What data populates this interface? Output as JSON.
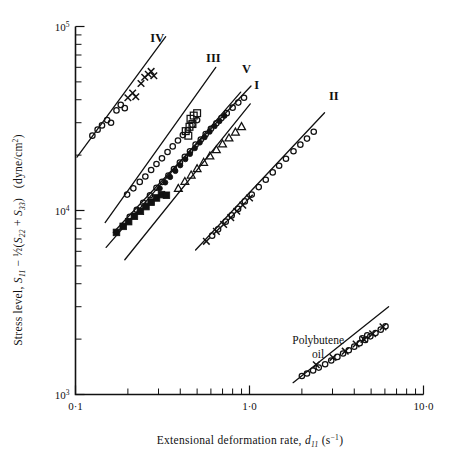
{
  "figure": {
    "background_color": "#ffffff",
    "ink_color": "#111111"
  },
  "chart_data": {
    "type": "scatter",
    "title": "",
    "subtitle": "",
    "xlabel": "Extensional deformation rate, d₁₁ (s⁻¹)",
    "ylabel": "Stress level, S₁₁ − ½(S₂₂ + S₃₃)  (dyne/cm²)",
    "xscale": "log",
    "yscale": "log",
    "xlim": [
      0.1,
      10.0
    ],
    "ylim": [
      1000,
      100000
    ],
    "grid": false,
    "legend_position": "inline-curve-labels",
    "xticks": [
      {
        "value": 0.1,
        "label": "0·1",
        "major": true
      },
      {
        "value": 0.2,
        "label": "",
        "major": false
      },
      {
        "value": 0.3,
        "label": "",
        "major": false
      },
      {
        "value": 0.4,
        "label": "",
        "major": false
      },
      {
        "value": 0.5,
        "label": "",
        "major": false
      },
      {
        "value": 0.6,
        "label": "",
        "major": false
      },
      {
        "value": 0.7,
        "label": "",
        "major": false
      },
      {
        "value": 0.8,
        "label": "",
        "major": false
      },
      {
        "value": 0.9,
        "label": "",
        "major": false
      },
      {
        "value": 1.0,
        "label": "1·0",
        "major": true
      },
      {
        "value": 2.0,
        "label": "",
        "major": false
      },
      {
        "value": 3.0,
        "label": "",
        "major": false
      },
      {
        "value": 4.0,
        "label": "",
        "major": false
      },
      {
        "value": 5.0,
        "label": "",
        "major": false
      },
      {
        "value": 6.0,
        "label": "",
        "major": false
      },
      {
        "value": 7.0,
        "label": "",
        "major": false
      },
      {
        "value": 8.0,
        "label": "",
        "major": false
      },
      {
        "value": 9.0,
        "label": "",
        "major": false
      },
      {
        "value": 10.0,
        "label": "10·0",
        "major": true
      }
    ],
    "yticks": [
      {
        "value": 1000,
        "label": "10³",
        "major": true
      },
      {
        "value": 2000,
        "label": "",
        "major": false
      },
      {
        "value": 3000,
        "label": "",
        "major": false
      },
      {
        "value": 4000,
        "label": "",
        "major": false
      },
      {
        "value": 5000,
        "label": "",
        "major": false
      },
      {
        "value": 6000,
        "label": "",
        "major": false
      },
      {
        "value": 7000,
        "label": "",
        "major": false
      },
      {
        "value": 8000,
        "label": "",
        "major": false
      },
      {
        "value": 9000,
        "label": "",
        "major": false
      },
      {
        "value": 10000,
        "label": "10⁴",
        "major": true
      },
      {
        "value": 20000,
        "label": "",
        "major": false
      },
      {
        "value": 30000,
        "label": "",
        "major": false
      },
      {
        "value": 40000,
        "label": "",
        "major": false
      },
      {
        "value": 50000,
        "label": "",
        "major": false
      },
      {
        "value": 60000,
        "label": "",
        "major": false
      },
      {
        "value": 70000,
        "label": "",
        "major": false
      },
      {
        "value": 80000,
        "label": "",
        "major": false
      },
      {
        "value": 90000,
        "label": "",
        "major": false
      },
      {
        "value": 100000,
        "label": "10⁵",
        "major": true
      }
    ],
    "axis_label_parts": {
      "y_prefix": "Stress level, ",
      "y_s11": "S",
      "y_s11_sub": "11",
      "y_minus": " − ",
      "y_half": "½",
      "y_open": "(",
      "y_s22": "S",
      "y_s22_sub": "22",
      "y_plus": " + ",
      "y_s33": "S",
      "y_s33_sub": "33",
      "y_close": ")",
      "y_units": "(dyne/cm",
      "y_units_sup": "2",
      "y_units_close": ")",
      "x_prefix": "Extensional deformation rate, ",
      "x_d": "d",
      "x_d_sub": "11",
      "x_units_open": " (s",
      "x_units_sup": "−1",
      "x_units_close": ")"
    },
    "annotations": [
      {
        "name": "polybutene-oil-label",
        "text_line1": "Polybutene",
        "text_line2": "oil",
        "x": 2.48,
        "y": 1880
      }
    ],
    "series": [
      {
        "name": "I",
        "label": "I",
        "label_x": 1.1,
        "label_y": 46000,
        "marker": "circle-open",
        "fit_line": {
          "x1": 0.165,
          "y1": 7600,
          "x2": 1.02,
          "y2": 47500
        },
        "points": [
          {
            "x": 0.205,
            "y": 9250
          },
          {
            "x": 0.225,
            "y": 10100
          },
          {
            "x": 0.245,
            "y": 11000
          },
          {
            "x": 0.268,
            "y": 12100
          },
          {
            "x": 0.292,
            "y": 13300
          },
          {
            "x": 0.315,
            "y": 14300
          },
          {
            "x": 0.342,
            "y": 15500
          },
          {
            "x": 0.368,
            "y": 16800
          },
          {
            "x": 0.398,
            "y": 18200
          },
          {
            "x": 0.425,
            "y": 19600
          },
          {
            "x": 0.455,
            "y": 21000
          },
          {
            "x": 0.49,
            "y": 22800
          },
          {
            "x": 0.525,
            "y": 24300
          },
          {
            "x": 0.56,
            "y": 26000
          },
          {
            "x": 0.6,
            "y": 27800
          },
          {
            "x": 0.645,
            "y": 29800
          },
          {
            "x": 0.69,
            "y": 31800
          },
          {
            "x": 0.74,
            "y": 33800
          },
          {
            "x": 0.8,
            "y": 36200
          },
          {
            "x": 0.862,
            "y": 38600
          },
          {
            "x": 0.93,
            "y": 41000
          }
        ]
      },
      {
        "name": "II",
        "label": "II",
        "label_x": 3.05,
        "label_y": 40000,
        "marker": "circle-open-and-cross",
        "fit_line": {
          "x1": 0.49,
          "y1": 6100,
          "x2": 2.7,
          "y2": 34000
        },
        "points": [
          {
            "x": 0.61,
            "y": 7300
          },
          {
            "x": 0.66,
            "y": 7900
          },
          {
            "x": 0.73,
            "y": 8700
          },
          {
            "x": 0.79,
            "y": 9400
          },
          {
            "x": 0.86,
            "y": 10200
          },
          {
            "x": 0.94,
            "y": 11200
          },
          {
            "x": 1.03,
            "y": 12200
          },
          {
            "x": 1.13,
            "y": 13400
          },
          {
            "x": 1.24,
            "y": 14700
          },
          {
            "x": 1.36,
            "y": 16100
          },
          {
            "x": 1.48,
            "y": 17500
          },
          {
            "x": 1.62,
            "y": 19100
          },
          {
            "x": 1.79,
            "y": 21000
          },
          {
            "x": 1.96,
            "y": 22800
          },
          {
            "x": 2.14,
            "y": 24600
          },
          {
            "x": 2.34,
            "y": 26800
          }
        ],
        "cross_points": [
          {
            "x": 0.565,
            "y": 6800
          },
          {
            "x": 0.645,
            "y": 7700
          },
          {
            "x": 0.71,
            "y": 8400
          },
          {
            "x": 0.78,
            "y": 9150
          },
          {
            "x": 0.845,
            "y": 9900
          },
          {
            "x": 0.915,
            "y": 10700
          },
          {
            "x": 1.0,
            "y": 11700
          }
        ]
      },
      {
        "name": "III",
        "label": "III",
        "label_x": 0.62,
        "label_y": 64000,
        "marker": "circle-open",
        "fit_line": {
          "x1": 0.148,
          "y1": 8600,
          "x2": 0.64,
          "y2": 60000
        },
        "points": [
          {
            "x": 0.198,
            "y": 12200
          },
          {
            "x": 0.215,
            "y": 13200
          },
          {
            "x": 0.234,
            "y": 14300
          },
          {
            "x": 0.252,
            "y": 15300
          },
          {
            "x": 0.272,
            "y": 16600
          },
          {
            "x": 0.292,
            "y": 17900
          },
          {
            "x": 0.314,
            "y": 19200
          },
          {
            "x": 0.338,
            "y": 20800
          },
          {
            "x": 0.362,
            "y": 22300
          },
          {
            "x": 0.388,
            "y": 24000
          },
          {
            "x": 0.414,
            "y": 25700
          },
          {
            "x": 0.442,
            "y": 27400
          },
          {
            "x": 0.47,
            "y": 29200
          },
          {
            "x": 0.5,
            "y": 31000
          }
        ]
      },
      {
        "name": "IV",
        "label": "IV",
        "label_x": 0.295,
        "label_y": 82000,
        "marker": "circle-open-and-cross",
        "fit_line": {
          "x1": 0.102,
          "y1": 19500,
          "x2": 0.33,
          "y2": 88000
        },
        "points": [
          {
            "x": 0.125,
            "y": 25500
          },
          {
            "x": 0.134,
            "y": 27500
          },
          {
            "x": 0.142,
            "y": 29000
          },
          {
            "x": 0.152,
            "y": 31000
          },
          {
            "x": 0.16,
            "y": 30000
          },
          {
            "x": 0.172,
            "y": 35000
          },
          {
            "x": 0.182,
            "y": 37500
          },
          {
            "x": 0.192,
            "y": 36000
          }
        ],
        "cross_points": [
          {
            "x": 0.2,
            "y": 41000
          },
          {
            "x": 0.213,
            "y": 43500
          },
          {
            "x": 0.222,
            "y": 41500
          },
          {
            "x": 0.238,
            "y": 49000
          },
          {
            "x": 0.25,
            "y": 53000
          },
          {
            "x": 0.262,
            "y": 55000
          },
          {
            "x": 0.272,
            "y": 57000
          },
          {
            "x": 0.282,
            "y": 54000
          }
        ]
      },
      {
        "name": "V",
        "label": "V",
        "label_x": 0.96,
        "label_y": 56000,
        "marker": "square-filled-and-open",
        "fit_line": {
          "x1": 0.15,
          "y1": 6300,
          "x2": 0.89,
          "y2": 44000
        },
        "points": [
          {
            "x": 0.172,
            "y": 7600
          },
          {
            "x": 0.188,
            "y": 8200
          },
          {
            "x": 0.202,
            "y": 8700
          },
          {
            "x": 0.218,
            "y": 9300
          },
          {
            "x": 0.236,
            "y": 9900
          },
          {
            "x": 0.254,
            "y": 10500
          },
          {
            "x": 0.272,
            "y": 11100
          },
          {
            "x": 0.292,
            "y": 11700
          },
          {
            "x": 0.312,
            "y": 12200
          },
          {
            "x": 0.333,
            "y": 12100
          }
        ],
        "open_square_points": [
          {
            "x": 0.458,
            "y": 31500
          },
          {
            "x": 0.478,
            "y": 32800
          },
          {
            "x": 0.5,
            "y": 33800
          },
          {
            "x": 0.452,
            "y": 28500
          },
          {
            "x": 0.47,
            "y": 29500
          },
          {
            "x": 0.43,
            "y": 27000
          },
          {
            "x": 0.445,
            "y": 25500
          }
        ]
      },
      {
        "name": "VI-filled-circles",
        "label": "",
        "label_x": 0,
        "label_y": 0,
        "marker": "circle-filled",
        "fit_line": null,
        "points": [
          {
            "x": 0.305,
            "y": 13200
          },
          {
            "x": 0.328,
            "y": 14200
          },
          {
            "x": 0.35,
            "y": 15200
          },
          {
            "x": 0.375,
            "y": 16400
          },
          {
            "x": 0.4,
            "y": 17600
          },
          {
            "x": 0.428,
            "y": 19000
          },
          {
            "x": 0.455,
            "y": 20300
          },
          {
            "x": 0.485,
            "y": 21800
          },
          {
            "x": 0.518,
            "y": 23400
          },
          {
            "x": 0.552,
            "y": 25000
          },
          {
            "x": 0.59,
            "y": 26800
          },
          {
            "x": 0.63,
            "y": 28700
          },
          {
            "x": 0.672,
            "y": 30600
          },
          {
            "x": 0.718,
            "y": 32700
          }
        ]
      },
      {
        "name": "VII-triangles",
        "label": "",
        "label_x": 0,
        "label_y": 0,
        "marker": "triangle-open",
        "fit_line": {
          "x1": 0.192,
          "y1": 5400,
          "x2": 1.01,
          "y2": 38000
        },
        "points": [
          {
            "x": 0.39,
            "y": 13200
          },
          {
            "x": 0.425,
            "y": 14400
          },
          {
            "x": 0.462,
            "y": 15600
          },
          {
            "x": 0.5,
            "y": 16900
          },
          {
            "x": 0.545,
            "y": 18300
          },
          {
            "x": 0.592,
            "y": 19800
          },
          {
            "x": 0.645,
            "y": 21400
          },
          {
            "x": 0.7,
            "y": 23000
          },
          {
            "x": 0.762,
            "y": 24800
          },
          {
            "x": 0.83,
            "y": 26700
          },
          {
            "x": 0.9,
            "y": 28600
          }
        ]
      },
      {
        "name": "polybutene-oil",
        "label": "",
        "label_x": 0,
        "label_y": 0,
        "marker": "circle-open-and-cross",
        "fit_line": {
          "x1": 1.78,
          "y1": 1160,
          "x2": 6.3,
          "y2": 3000
        },
        "points": [
          {
            "x": 2.0,
            "y": 1260
          },
          {
            "x": 2.14,
            "y": 1300
          },
          {
            "x": 2.32,
            "y": 1350
          },
          {
            "x": 2.5,
            "y": 1400
          },
          {
            "x": 2.72,
            "y": 1460
          },
          {
            "x": 2.95,
            "y": 1530
          },
          {
            "x": 3.2,
            "y": 1600
          },
          {
            "x": 3.45,
            "y": 1670
          },
          {
            "x": 3.72,
            "y": 1740
          },
          {
            "x": 4.0,
            "y": 1820
          },
          {
            "x": 4.3,
            "y": 1900
          },
          {
            "x": 4.62,
            "y": 1980
          },
          {
            "x": 4.95,
            "y": 2070
          },
          {
            "x": 5.3,
            "y": 2160
          },
          {
            "x": 5.68,
            "y": 2250
          },
          {
            "x": 6.05,
            "y": 2350
          },
          {
            "x": 4.45,
            "y": 2020
          },
          {
            "x": 4.75,
            "y": 2100
          }
        ],
        "cross_points": [
          {
            "x": 2.42,
            "y": 1450
          },
          {
            "x": 3.02,
            "y": 1590
          },
          {
            "x": 3.55,
            "y": 1720
          },
          {
            "x": 4.1,
            "y": 1880
          },
          {
            "x": 4.55,
            "y": 1990
          },
          {
            "x": 5.1,
            "y": 2140
          },
          {
            "x": 5.85,
            "y": 2330
          }
        ]
      }
    ]
  }
}
